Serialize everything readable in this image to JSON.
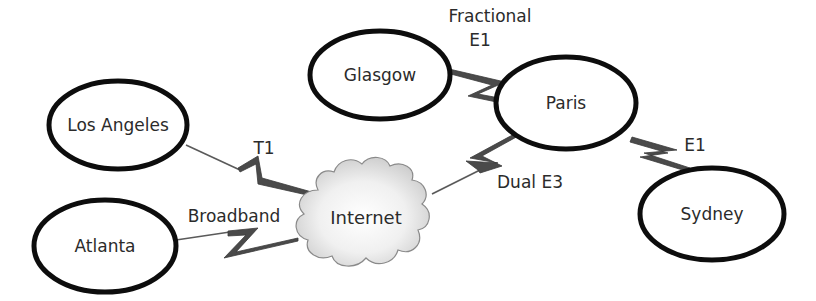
{
  "diagram": {
    "type": "network-topology",
    "colors": {
      "node_stroke": "#0d0d0d",
      "link": "#4a4a4a",
      "cloud_fill": "#dcdcdc",
      "text": "#2b2b2b"
    },
    "nodes": {
      "glasgow": {
        "label": "Glasgow"
      },
      "paris": {
        "label": "Paris"
      },
      "los_angeles": {
        "label": "Los Angeles"
      },
      "atlanta": {
        "label": "Atlanta"
      },
      "sydney": {
        "label": "Sydney"
      },
      "internet": {
        "label": "Internet",
        "shape": "cloud"
      }
    },
    "links": {
      "glasgow_paris": {
        "from": "Glasgow",
        "to": "Paris",
        "label_line1": "Fractional",
        "label_line2": "E1"
      },
      "losangeles_internet": {
        "from": "Los Angeles",
        "to": "Internet",
        "label": "T1"
      },
      "atlanta_internet": {
        "from": "Atlanta",
        "to": "Internet",
        "label": "Broadband"
      },
      "internet_paris": {
        "from": "Internet",
        "to": "Paris",
        "label": "Dual E3"
      },
      "paris_sydney": {
        "from": "Paris",
        "to": "Sydney",
        "label": "E1"
      }
    }
  }
}
